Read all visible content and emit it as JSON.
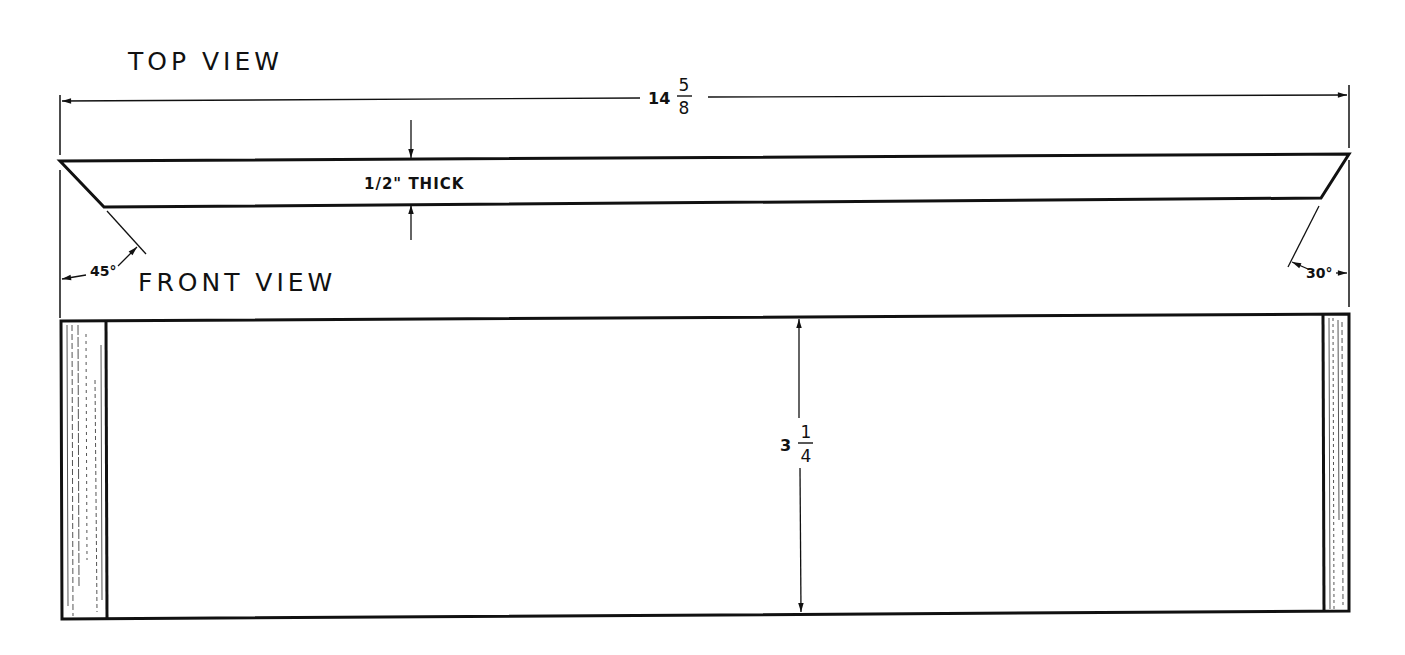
{
  "drawing": {
    "top_view": {
      "title": "TOP VIEW",
      "overall_length": {
        "whole": "14",
        "numerator": "5",
        "denominator": "8"
      },
      "thickness_note": "1/2\" THICK",
      "left_angle": "45°",
      "right_angle": "30°"
    },
    "front_view": {
      "title": "FRONT VIEW",
      "height": {
        "whole": "3",
        "numerator": "1",
        "denominator": "4"
      }
    },
    "colors": {
      "line": "#111111",
      "background": "#ffffff",
      "hatch": "#555555"
    }
  }
}
